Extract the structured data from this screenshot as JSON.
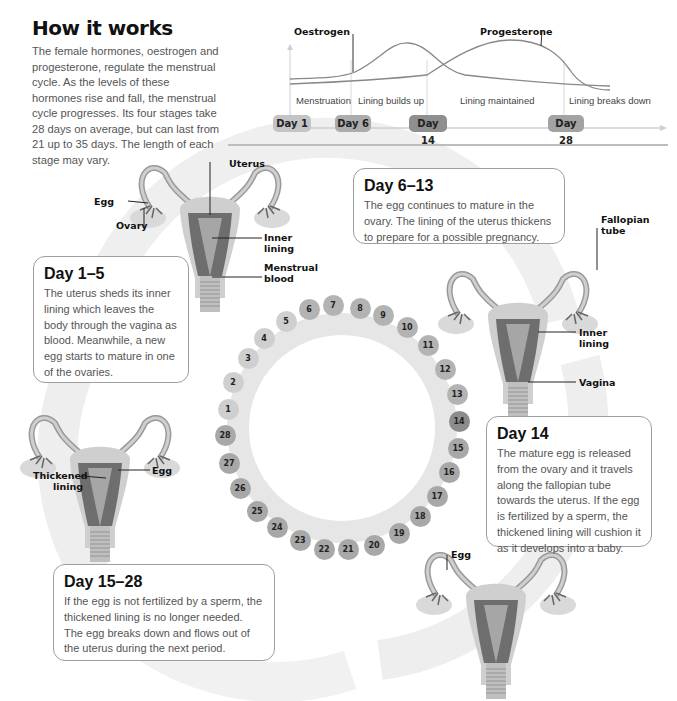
{
  "header": {
    "title": "How it works",
    "intro": "The female hormones, oestrogen and progesterone, regulate the menstrual cycle. As the levels of these hormones rise and fall, the menstrual cycle progresses. Its four stages take 28 days on average, but can last from 21 up to 35 days. The length of each stage may vary."
  },
  "hormone_chart": {
    "series": [
      {
        "name": "Oestrogen",
        "color": "#8a8a8a"
      },
      {
        "name": "Progesterone",
        "color": "#8a8a8a"
      }
    ],
    "phases": [
      "Menstruation",
      "Lining builds up",
      "Lining maintained",
      "Lining breaks down"
    ],
    "day_markers": [
      {
        "label": "Day 1",
        "color": "#c4c4c4"
      },
      {
        "label": "Day 6",
        "color": "#acacac"
      },
      {
        "label": "Day 14",
        "color": "#8f8f8f"
      },
      {
        "label": "Day 28",
        "color": "#a3a3a3"
      }
    ]
  },
  "stages": [
    {
      "title": "Day 1–5",
      "text": " The uterus sheds its inner lining which leaves the body through the vagina as blood. Meanwhile, a new egg starts to mature in one of the ovaries."
    },
    {
      "title": "Day 6–13",
      "text": "The egg continues to mature in the ovary. The lining of the uterus thickens to prepare for a possible pregnancy."
    },
    {
      "title": "Day 14",
      "text": "The mature egg is released from the ovary and it travels along the fallopian tube towards the uterus. If the egg is fertilized by a sperm, the thickened lining will cushion it as it develops into a baby."
    },
    {
      "title": "Day 15–28",
      "text": "If the egg is not fertilized by a sperm, the thickened lining is no longer needed. The egg breaks down and flows out of the uterus during the next period."
    }
  ],
  "labels": {
    "d1": {
      "uterus": "Uterus",
      "egg": "Egg",
      "ovary": "Ovary",
      "inner_lining": "Inner lining",
      "menstrual_blood": "Menstrual blood"
    },
    "d6": {
      "fallopian_tube": "Fallopian tube",
      "inner_lining": "Inner lining",
      "vagina": "Vagina"
    },
    "d14": {
      "egg": "Egg"
    },
    "d15": {
      "thickened_lining": "Thickened lining",
      "egg": "Egg"
    }
  },
  "cycle_days": [
    {
      "day": "1",
      "color": "#cfcfcf"
    },
    {
      "day": "2",
      "color": "#cfcfcf"
    },
    {
      "day": "3",
      "color": "#cfcfcf"
    },
    {
      "day": "4",
      "color": "#cfcfcf"
    },
    {
      "day": "5",
      "color": "#cfcfcf"
    },
    {
      "day": "6",
      "color": "#b3b3b3"
    },
    {
      "day": "7",
      "color": "#b3b3b3"
    },
    {
      "day": "8",
      "color": "#b3b3b3"
    },
    {
      "day": "9",
      "color": "#b3b3b3"
    },
    {
      "day": "10",
      "color": "#b3b3b3"
    },
    {
      "day": "11",
      "color": "#b3b3b3"
    },
    {
      "day": "12",
      "color": "#b3b3b3"
    },
    {
      "day": "13",
      "color": "#b3b3b3"
    },
    {
      "day": "14",
      "color": "#8c8c8c"
    },
    {
      "day": "15",
      "color": "#a8a8a8"
    },
    {
      "day": "16",
      "color": "#a8a8a8"
    },
    {
      "day": "17",
      "color": "#a8a8a8"
    },
    {
      "day": "18",
      "color": "#a8a8a8"
    },
    {
      "day": "19",
      "color": "#a8a8a8"
    },
    {
      "day": "20",
      "color": "#a8a8a8"
    },
    {
      "day": "21",
      "color": "#a8a8a8"
    },
    {
      "day": "22",
      "color": "#a8a8a8"
    },
    {
      "day": "23",
      "color": "#a8a8a8"
    },
    {
      "day": "24",
      "color": "#a8a8a8"
    },
    {
      "day": "25",
      "color": "#a8a8a8"
    },
    {
      "day": "26",
      "color": "#a8a8a8"
    },
    {
      "day": "27",
      "color": "#a8a8a8"
    },
    {
      "day": "28",
      "color": "#a8a8a8"
    }
  ]
}
